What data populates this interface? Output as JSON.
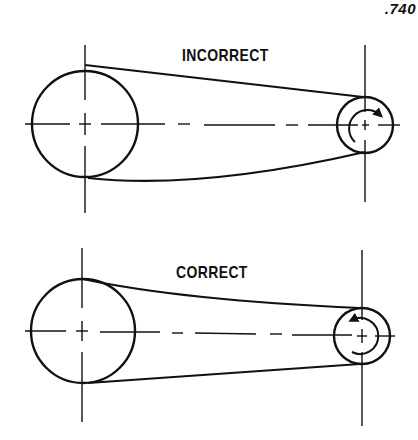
{
  "page_number": ".740",
  "diagrams": [
    {
      "id": "incorrect",
      "label": "INCORRECT",
      "rotation": "clockwise",
      "large_pulley": {
        "cx": 85,
        "cy": 124,
        "r": 53
      },
      "small_pulley": {
        "cx": 365,
        "cy": 125,
        "r": 28
      }
    },
    {
      "id": "correct",
      "label": "CORRECT",
      "rotation": "counterclockwise",
      "large_pulley": {
        "cx": 83,
        "cy": 331,
        "r": 52
      },
      "small_pulley": {
        "cx": 362,
        "cy": 336,
        "r": 28
      }
    }
  ],
  "colors": {
    "ink": "#111111",
    "background": "#ffffff"
  }
}
